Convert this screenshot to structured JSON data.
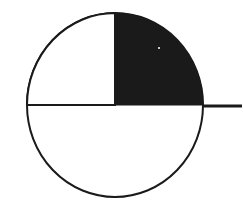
{
  "figure": {
    "width": 243,
    "height": 214,
    "background_color": "#ffffff",
    "title": "",
    "subtitle": ""
  },
  "pie": {
    "center_x": 115,
    "center_y": 105,
    "radius_x": 88,
    "radius_y": 92,
    "outline_color": "#1a1a1a",
    "outline_width": 2,
    "start_angle_deg": 270,
    "direction": "counterclockwise"
  },
  "leader_line": {
    "name": "leader-line",
    "x1": 203,
    "y1": 106,
    "x2": 242,
    "y2": 106,
    "color": "#1a1a1a",
    "width": 3,
    "label": ""
  },
  "artifact": {
    "x": 158,
    "y": 47,
    "size": 2
  },
  "chart_data": {
    "type": "pie",
    "title": "",
    "xlabel": "",
    "ylabel": "",
    "legend_position": "none",
    "grid": false,
    "start_angle_deg": 270,
    "counterclock": true,
    "labels": [
      "Slice A",
      "Slice B"
    ],
    "values": [
      75,
      25
    ],
    "percentages": [
      "75%",
      "25%"
    ],
    "colors": [
      "#1a1a1a",
      "#ffffff"
    ],
    "edge_color": "#1a1a1a",
    "annotations": [
      {
        "name": "pointer-tick",
        "text": "",
        "anchor_angle_deg": 0,
        "angle_position": "3-oclock",
        "leader_length_px": 39
      }
    ],
    "slices": [
      {
        "label": "Slice A",
        "value": 75,
        "percent": "75%",
        "color": "#1a1a1a",
        "start_angle_deg": 270,
        "end_angle_deg": 0,
        "sweep_deg": 270
      },
      {
        "label": "Slice B",
        "value": 25,
        "percent": "25%",
        "color": "#ffffff",
        "start_angle_deg": 180,
        "end_angle_deg": 270,
        "sweep_deg": 90
      }
    ]
  }
}
